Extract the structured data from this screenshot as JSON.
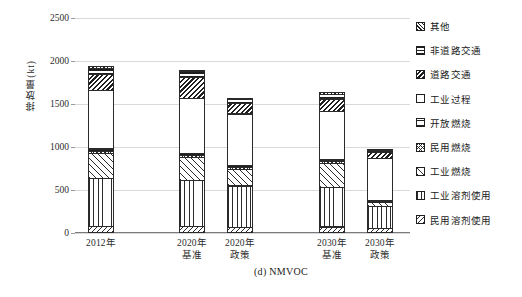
{
  "chart_data": {
    "type": "bar",
    "subtype": "stacked-bar",
    "title": "",
    "caption": "(d) NMVOC",
    "xlabel": "",
    "ylabel": "排放量(kt)",
    "ylim": [
      0,
      2500
    ],
    "ytick_step": 500,
    "ytick_labels": [
      "2500",
      "2000",
      "1500",
      "1000",
      "500",
      "0"
    ],
    "ytick_values": [
      2500,
      2000,
      1500,
      1000,
      500,
      0
    ],
    "grid": true,
    "legend_position": "right",
    "categories": [
      "2012年",
      "2020年\n基准",
      "2020年\n政策",
      "2030年\n基准",
      "2030年\n政策"
    ],
    "category_labels": [
      {
        "line1": "2012年",
        "line2": ""
      },
      {
        "line1": "2020年",
        "line2": "基准"
      },
      {
        "line1": "2020年",
        "line2": "政策"
      },
      {
        "line1": "2030年",
        "line2": "基准"
      },
      {
        "line1": "2030年",
        "line2": "政策"
      }
    ],
    "stack_order_bottom_to_top": [
      "民用溶剂使用",
      "工业溶剂使用",
      "工业燃烧",
      "民用燃烧",
      "开放燃烧",
      "工业过程",
      "道路交通",
      "非道路交通",
      "其他"
    ],
    "series": [
      {
        "name": "民用溶剂使用",
        "pattern": "p-ressolv",
        "values": [
          85,
          80,
          70,
          75,
          55
        ]
      },
      {
        "name": "工业溶剂使用",
        "pattern": "p-indsolv",
        "values": [
          560,
          545,
          490,
          465,
          265
        ]
      },
      {
        "name": "工业燃烧",
        "pattern": "p-indcomb",
        "values": [
          300,
          275,
          205,
          290,
          55
        ]
      },
      {
        "name": "民用燃烧",
        "pattern": "p-rescomb",
        "values": [
          40,
          35,
          30,
          30,
          20
        ]
      },
      {
        "name": "开放燃烧",
        "pattern": "p-openburn",
        "values": [
          35,
          35,
          30,
          30,
          25
        ]
      },
      {
        "name": "工业过程",
        "pattern": "p-indproc",
        "values": [
          690,
          650,
          610,
          575,
          495
        ]
      },
      {
        "name": "道路交通",
        "pattern": "p-road",
        "values": [
          195,
          250,
          135,
          155,
          85
        ]
      },
      {
        "name": "非道路交通",
        "pattern": "p-nonroad",
        "values": [
          80,
          75,
          50,
          65,
          30
        ]
      },
      {
        "name": "其他",
        "pattern": "p-other",
        "values": [
          35,
          30,
          20,
          25,
          20
        ]
      }
    ],
    "totals": [
      2020,
      1975,
      1640,
      1710,
      1050
    ]
  },
  "legend": {
    "items": [
      {
        "label": "其他",
        "pattern": "p-other"
      },
      {
        "label": "非道路交通",
        "pattern": "p-nonroad"
      },
      {
        "label": "道路交通",
        "pattern": "p-road"
      },
      {
        "label": "工业过程",
        "pattern": "p-indproc"
      },
      {
        "label": "开放燃烧",
        "pattern": "p-openburn"
      },
      {
        "label": "民用燃烧",
        "pattern": "p-rescomb"
      },
      {
        "label": "工业燃烧",
        "pattern": "p-indcomb"
      },
      {
        "label": "工业溶剂使用",
        "pattern": "p-indsolv"
      },
      {
        "label": "民用溶剂使用",
        "pattern": "p-ressolv"
      }
    ]
  },
  "colors": {
    "background": "#ffffff",
    "gridline": "#d9d9d9",
    "axis": "#7a7a7a",
    "outline": "#2a2a2a",
    "text": "#1a1a1a"
  }
}
